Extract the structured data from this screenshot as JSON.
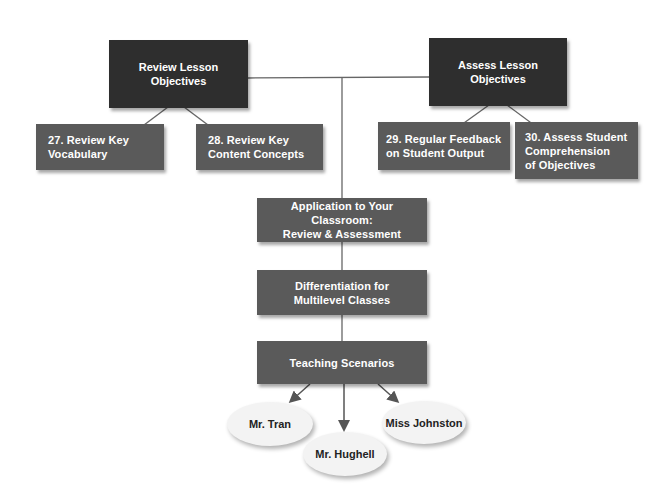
{
  "colors": {
    "top_box": "#2e2e2e",
    "sub_box": "#5a5a5a",
    "line": "#555555",
    "ellipse_fill": "#f3f3f3",
    "background": "#ffffff"
  },
  "top_nodes": [
    {
      "id": "review-lesson-objectives",
      "label": "Review Lesson\nObjectives"
    },
    {
      "id": "assess-lesson-objectives",
      "label": "Assess Lesson\nObjectives"
    }
  ],
  "sub_nodes": [
    {
      "id": "27",
      "parent": "review-lesson-objectives",
      "label": "27. Review Key\n      Vocabulary"
    },
    {
      "id": "28",
      "parent": "review-lesson-objectives",
      "label": "28. Review Key\n      Content Concepts"
    },
    {
      "id": "29",
      "parent": "assess-lesson-objectives",
      "label": "29. Regular Feedback\n      on Student Output"
    },
    {
      "id": "30",
      "parent": "assess-lesson-objectives",
      "label": "30. Assess Student\n      Comprehension\n      of Objectives"
    }
  ],
  "flow_nodes": [
    {
      "id": "application",
      "label": "Application to Your Classroom:\nReview & Assessment"
    },
    {
      "id": "differentiation",
      "label": "Differentiation for\nMultilevel Classes"
    },
    {
      "id": "teaching-scenarios",
      "label": "Teaching Scenarios"
    }
  ],
  "scenarios": [
    {
      "id": "mr-tran",
      "label": "Mr. Tran"
    },
    {
      "id": "mr-hughell",
      "label": "Mr. Hughell"
    },
    {
      "id": "miss-johnston",
      "label": "Miss Johnston"
    }
  ]
}
